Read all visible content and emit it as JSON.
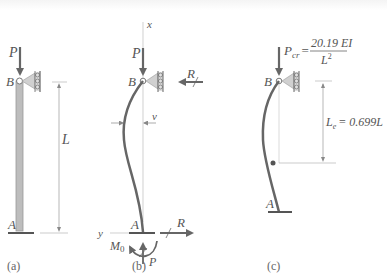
{
  "figure": {
    "panels": [
      {
        "id": "a",
        "caption": "(a)",
        "labels": {
          "load": "P",
          "top": "B",
          "bottom": "A",
          "length": "L"
        }
      },
      {
        "id": "b",
        "caption": "(b)",
        "labels": {
          "axis_x": "x",
          "axis_y": "y",
          "load": "P",
          "top": "B",
          "bottom": "A",
          "reaction_top": "R",
          "reaction_bottom": "R",
          "deflection": "v",
          "moment": "M",
          "moment_sub": "0",
          "axial": "P"
        }
      },
      {
        "id": "c",
        "caption": "(c)",
        "labels": {
          "load": "P",
          "load_sub": "cr",
          "equals": "=",
          "numerator": "20.19 EI",
          "denominator": "L",
          "denominator_exp": "2",
          "top": "B",
          "bottom": "A",
          "effective_length": "L",
          "effective_length_sub": "e",
          "effective_length_value": "= 0.699L"
        }
      }
    ],
    "colors": {
      "member": "#666666",
      "member_fill": "#bdbdbd",
      "support": "#cfcfcf",
      "dim_line": "#999999",
      "text": "#555555"
    }
  }
}
